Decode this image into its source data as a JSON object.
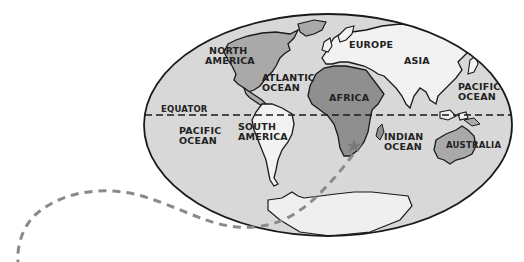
{
  "map": {
    "type": "world-map-oval-projection",
    "colors": {
      "ocean": "#d8d8d8",
      "north_america": "#a9a9a9",
      "south_america": "#f2f2f2",
      "europe_asia": "#f2f2f2",
      "africa": "#8f8f8f",
      "australia": "#a9a9a9",
      "antarctica": "#efefef",
      "outline": "#1a1a1a",
      "route": "#8a8a8a",
      "star": "#7a7a7a"
    },
    "labels": {
      "north_america": [
        "NORTH",
        "AMERICA"
      ],
      "atlantic_ocean": [
        "ATLANTIC",
        "OCEAN"
      ],
      "europe": "EUROPE",
      "asia": "ASIA",
      "africa": "AFRICA",
      "pacific_ocean_east": [
        "PACIFIC",
        "OCEAN"
      ],
      "pacific_ocean_west": [
        "PACIFIC",
        "OCEAN"
      ],
      "equator": "EQUATOR",
      "south_america": [
        "SOUTH",
        "AMERICA"
      ],
      "indian_ocean": [
        "INDIAN",
        "OCEAN"
      ],
      "australia": "AUSTRALIA"
    },
    "markers": [
      {
        "name": "star",
        "location": "southern Africa"
      }
    ],
    "route": {
      "style": "dashed",
      "description": "dashed path from star in southern Africa down past Antarctica, curving left off the map"
    }
  }
}
